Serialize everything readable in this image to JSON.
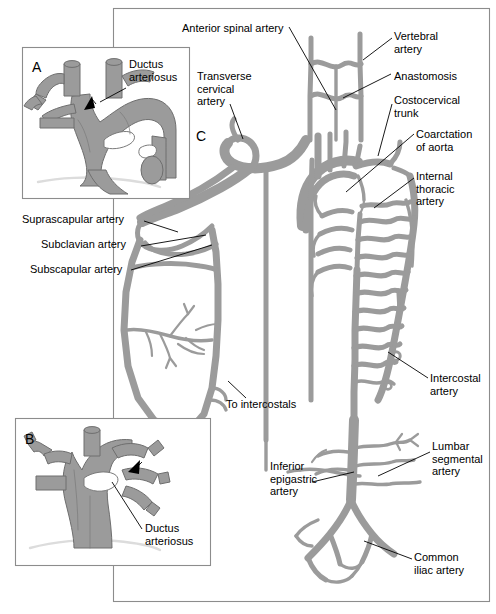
{
  "figure": {
    "type": "medical-illustration",
    "panels": [
      {
        "id": "A",
        "letter": "A",
        "caption": "Ductus arteriosus",
        "description": "Oblique view of aortic arch and great vessels with patent ductus arteriosus indicated by arrow",
        "frame": {
          "x": 22,
          "y": 47,
          "w": 168,
          "h": 152
        }
      },
      {
        "id": "B",
        "letter": "B",
        "caption": "Ductus arteriosus",
        "description": "Anterior view of aortic arch and great vessels with ductus arteriosus indicated by arrow",
        "frame": {
          "x": 15,
          "y": 418,
          "w": 196,
          "h": 148
        }
      },
      {
        "id": "C",
        "letter": "C",
        "caption": "",
        "description": "Main diagram of collateral arterial circulation bypassing aortic coarctation",
        "frame": {
          "x": 113,
          "y": 8,
          "w": 377,
          "h": 594
        }
      }
    ],
    "labels": [
      {
        "key": "anterior_spinal_artery",
        "text": "Anterior spinal artery",
        "x": 182,
        "y": 22,
        "align": "left"
      },
      {
        "key": "vertebral_artery",
        "text": "Vertebral\nartery",
        "x": 394,
        "y": 30,
        "align": "left"
      },
      {
        "key": "anastomosis",
        "text": "Anastomosis",
        "x": 394,
        "y": 70,
        "align": "left"
      },
      {
        "key": "costocervical_trunk",
        "text": "Costocervical\ntrunk",
        "x": 394,
        "y": 94,
        "align": "left"
      },
      {
        "key": "coarctation_of_aorta",
        "text": "Coarctation\nof aorta",
        "x": 416,
        "y": 128,
        "align": "left"
      },
      {
        "key": "internal_thoracic_artery",
        "text": "Internal\nthoracic\nartery",
        "x": 416,
        "y": 170,
        "align": "left"
      },
      {
        "key": "transverse_cervical_artery",
        "text": "Transverse\ncervical\nartery",
        "x": 197,
        "y": 70,
        "align": "left"
      },
      {
        "key": "suprascapular_artery",
        "text": "Suprascapular artery",
        "x": 22,
        "y": 219,
        "align": "left"
      },
      {
        "key": "subclavian_artery",
        "text": "Subclavian artery",
        "x": 41,
        "y": 243,
        "align": "left"
      },
      {
        "key": "subscapular_artery",
        "text": "Subscapular artery",
        "x": 30,
        "y": 267,
        "align": "left"
      },
      {
        "key": "intercostal_artery",
        "text": "Intercostal\nartery",
        "x": 430,
        "y": 372,
        "align": "left"
      },
      {
        "key": "to_intercostals",
        "text": "To intercostals",
        "x": 226,
        "y": 404,
        "align": "left"
      },
      {
        "key": "lumbar_segmental_artery",
        "text": "Lumbar\nsegmental\nartery",
        "x": 432,
        "y": 440,
        "align": "left"
      },
      {
        "key": "inferior_epigastric_artery",
        "text": "Inferior\nepigastric\nartery",
        "x": 270,
        "y": 460,
        "align": "left"
      },
      {
        "key": "ductus_arteriosus_a",
        "text": "Ductus\narteriosus",
        "x": 129,
        "y": 62,
        "align": "left"
      },
      {
        "key": "ductus_arteriosus_b",
        "text": "Ductus\narteriosus",
        "x": 145,
        "y": 528,
        "align": "left"
      },
      {
        "key": "common_iliac_artery",
        "text": "Common\niliac artery",
        "x": 414,
        "y": 553,
        "align": "left"
      }
    ],
    "colors": {
      "vessel_fill": "#9b9b9b",
      "vessel_stroke": "#6e6e6e",
      "vessel_shadow": "#d8d8d8",
      "panel_border": "#8c8c8c",
      "leader_line": "#000000",
      "background": "#ffffff",
      "text": "#000000"
    }
  }
}
